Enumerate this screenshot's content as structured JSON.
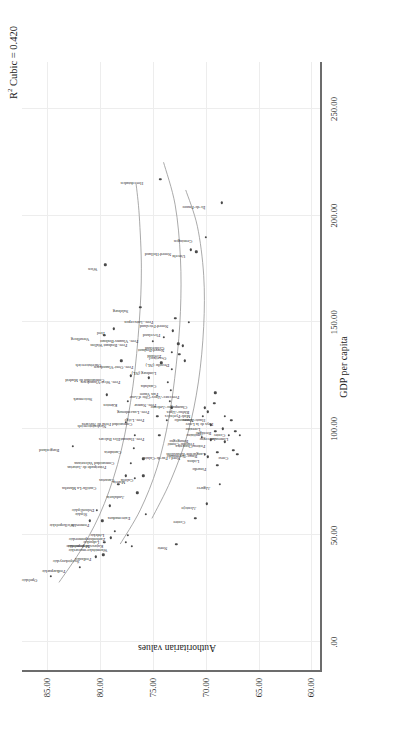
{
  "annotation": {
    "r2_label": "R",
    "r2_sup": "2",
    "r2_rest": " Cubic = 0.420"
  },
  "axes": {
    "x": {
      "title": "GDP per capita",
      "ticks": [
        ".00",
        "50.00",
        "100.00",
        "150.00",
        "200.00",
        "250.00"
      ],
      "tick_values": [
        0,
        50,
        100,
        150,
        200,
        250
      ],
      "min": -14,
      "max": 272
    },
    "y": {
      "title": "Authoritarian values",
      "ticks": [
        "60.00",
        "65.00",
        "70.00",
        "75.00",
        "80.00",
        "85.00"
      ],
      "tick_values": [
        60,
        65,
        70,
        75,
        80,
        85
      ],
      "min": 59.0,
      "max": 87.4
    }
  },
  "chart_data": {
    "type": "scatter",
    "title": "",
    "xlabel": "GDP per capita",
    "ylabel": "Authoritarian values",
    "xlim": [
      -14,
      272
    ],
    "ylim": [
      59.0,
      87.4
    ],
    "grid": true,
    "legend": null,
    "annotations": [
      "R² Cubic = 0.420"
    ],
    "fit": {
      "type": "cubic",
      "r_squared": 0.42,
      "n_curves": 3
    },
    "points": [
      {
        "label": "Opolskie",
        "x": 31,
        "y": 84.7,
        "lx": -2,
        "ly": -16,
        "rot": -90
      },
      {
        "label": "Podkarpackie",
        "x": 35,
        "y": 81.9,
        "lx": -2,
        "ly": -17,
        "rot": -90
      },
      {
        "label": "Świętokrzyskie",
        "x": 40,
        "y": 80.4,
        "lx": -2,
        "ly": -19,
        "rot": -90
      },
      {
        "label": "Wielkopolskie",
        "x": 57,
        "y": 81.0,
        "lx": -2,
        "ly": -18,
        "rot": -90
      },
      {
        "label": "Śląskie",
        "x": 62,
        "y": 80.3,
        "lx": -2,
        "ly": -12,
        "rot": -90
      },
      {
        "label": "Podlaskie",
        "x": 41,
        "y": 79.7,
        "lx": -2,
        "ly": -14,
        "rot": -90
      },
      {
        "label": "Małopolskie",
        "x": 47,
        "y": 79.6,
        "lx": -2,
        "ly": -17,
        "rot": -90
      },
      {
        "label": "Pomorskie",
        "x": 57,
        "y": 79.8,
        "lx": -2,
        "ly": -15,
        "rot": -90
      },
      {
        "label": "Lubuskie",
        "x": 49,
        "y": 79.0,
        "lx": -2,
        "ly": -14,
        "rot": -90
      },
      {
        "label": "Łódzkie",
        "x": 52,
        "y": 78.6,
        "lx": -2,
        "ly": -13,
        "rot": -90
      },
      {
        "label": "Dolnośląskie",
        "x": 64,
        "y": 79.1,
        "lx": -2,
        "ly": -18,
        "rot": -90
      },
      {
        "label": "Kujawsko-pomorskie",
        "x": 47,
        "y": 77.6,
        "lx": -2,
        "ly": -25,
        "rot": -90
      },
      {
        "label": "Zachodniopomorskie",
        "x": 50,
        "y": 77.4,
        "lx": -2,
        "ly": -25,
        "rot": -90
      },
      {
        "label": "Warmińsko-mazurskie",
        "x": 45,
        "y": 77.0,
        "lx": -2,
        "ly": -27,
        "rot": -90
      },
      {
        "label": "Burgenland",
        "x": 92,
        "y": 82.6,
        "lx": -2,
        "ly": -16,
        "rot": -90
      },
      {
        "label": "Castilla-La Mancha",
        "x": 74,
        "y": 78.3,
        "lx": -2,
        "ly": -24,
        "rot": -90
      },
      {
        "label": "Canarias",
        "x": 78,
        "y": 77.6,
        "lx": -2,
        "ly": -14,
        "rot": -90
      },
      {
        "label": "Murcia",
        "x": 77,
        "y": 76.7,
        "lx": -2,
        "ly": -12,
        "rot": -90
      },
      {
        "label": "Andalucía",
        "x": 70,
        "y": 76.5,
        "lx": -2,
        "ly": -15,
        "rot": -90
      },
      {
        "label": "Principado de Asturias",
        "x": 84,
        "y": 77.1,
        "lx": -2,
        "ly": -27,
        "rot": -90
      },
      {
        "label": "Extremadura",
        "x": 60,
        "y": 75.7,
        "lx": -2,
        "ly": -18,
        "rot": -90
      },
      {
        "label": "Cantabria",
        "x": 91,
        "y": 76.8,
        "lx": -2,
        "ly": -15,
        "rot": -90
      },
      {
        "label": "Illes Balears",
        "x": 97,
        "y": 76.7,
        "lx": -2,
        "ly": -17,
        "rot": -90
      },
      {
        "label": "Galicia",
        "x": 78,
        "y": 75.9,
        "lx": -2,
        "ly": -12,
        "rot": -90
      },
      {
        "label": "Comunidad Valenciana",
        "x": 86,
        "y": 75.9,
        "lx": -2,
        "ly": -31,
        "rot": -90
      },
      {
        "label": "Niederösterreich",
        "x": 103,
        "y": 77.6,
        "lx": -2,
        "ly": -22,
        "rot": -90
      },
      {
        "label": "Comunidad de Madrid",
        "x": 125,
        "y": 77.1,
        "lx": -2,
        "ly": -29,
        "rot": -90
      },
      {
        "label": "Kärnten",
        "x": 113,
        "y": 77.4,
        "lx": -2,
        "ly": -13,
        "rot": -90
      },
      {
        "label": "Oberösterreich",
        "x": 132,
        "y": 78.0,
        "lx": -2,
        "ly": -22,
        "rot": -90
      },
      {
        "label": "Steiermark",
        "x": 116,
        "y": 79.4,
        "lx": -2,
        "ly": -17,
        "rot": -90
      },
      {
        "label": "Vorarlberg",
        "x": 144,
        "y": 79.6,
        "lx": -2,
        "ly": -17,
        "rot": -90
      },
      {
        "label": "Tirol",
        "x": 147,
        "y": 78.7,
        "lx": -2,
        "ly": -11,
        "rot": -90
      },
      {
        "label": "Norte",
        "x": 46,
        "y": 72.8,
        "lx": -2,
        "ly": -11,
        "rot": -90
      },
      {
        "label": "Centro",
        "x": 58,
        "y": 71.0,
        "lx": -2,
        "ly": -12,
        "rot": -90
      },
      {
        "label": "Alentejo",
        "x": 65,
        "y": 69.9,
        "lx": -2,
        "ly": -13,
        "rot": -90
      },
      {
        "label": "Algarve",
        "x": 74,
        "y": 68.7,
        "lx": -2,
        "ly": -12,
        "rot": -90
      },
      {
        "label": "Lisboa",
        "x": 87,
        "y": 69.8,
        "lx": -2,
        "ly": -11,
        "rot": -90
      },
      {
        "label": "Prov. Hainaut",
        "x": 97,
        "y": 74.4,
        "lx": -2,
        "ly": -17,
        "rot": -90
      },
      {
        "label": "Prov. Liège",
        "x": 106,
        "y": 74.6,
        "lx": -2,
        "ly": -15,
        "rot": -90
      },
      {
        "label": "Comunidad Foral de Navarra",
        "x": 104,
        "y": 73.7,
        "lx": -2,
        "ly": -37,
        "rot": -90
      },
      {
        "label": "Prov. Luxembourg",
        "x": 110,
        "y": 73.2,
        "lx": -2,
        "ly": -25,
        "rot": -90
      },
      {
        "label": "Prov. Namur",
        "x": 113,
        "y": 73.4,
        "lx": -2,
        "ly": -16,
        "rot": -90
      },
      {
        "label": "País Vasco",
        "x": 118,
        "y": 73.3,
        "lx": -2,
        "ly": -15,
        "rot": -90
      },
      {
        "label": "Cataluña",
        "x": 122,
        "y": 73.6,
        "lx": -2,
        "ly": -14,
        "rot": -90
      },
      {
        "label": "Prov. West-Vlaanderen",
        "x": 124,
        "y": 75.4,
        "lx": -2,
        "ly": -31,
        "rot": -90
      },
      {
        "label": "Prov. Oost-Vlaanderen",
        "x": 131,
        "y": 74.2,
        "lx": -2,
        "ly": -30,
        "rot": -90
      },
      {
        "label": "Prov. Vlaams-Brabant",
        "x": 143,
        "y": 74.0,
        "lx": -2,
        "ly": -28,
        "rot": -90
      },
      {
        "label": "Prov. Brabant Wallon",
        "x": 141,
        "y": 75.0,
        "lx": -2,
        "ly": -28,
        "rot": -90
      },
      {
        "label": "Limburg (NL)",
        "x": 128,
        "y": 73.2,
        "lx": -2,
        "ly": -18,
        "rot": -90
      },
      {
        "label": "Zeeland",
        "x": 136,
        "y": 73.2,
        "lx": -2,
        "ly": -13,
        "rot": -90
      },
      {
        "label": "Gelderland",
        "x": 140,
        "y": 72.6,
        "lx": -2,
        "ly": -16,
        "rot": -90
      },
      {
        "label": "Overijssel",
        "x": 135,
        "y": 72.5,
        "lx": -2,
        "ly": -15,
        "rot": -90
      },
      {
        "label": "Drenthe (NL)",
        "x": 132,
        "y": 72.0,
        "lx": -2,
        "ly": -18,
        "rot": -90
      },
      {
        "label": "Noord-Brabant",
        "x": 139,
        "y": 72.2,
        "lx": -2,
        "ly": -21,
        "rot": -90
      },
      {
        "label": "Flevoland",
        "x": 146,
        "y": 73.1,
        "lx": -2,
        "ly": -15,
        "rot": -90
      },
      {
        "label": "Salzburg",
        "x": 157,
        "y": 76.2,
        "lx": -2,
        "ly": -14,
        "rot": -90
      },
      {
        "label": "Wien",
        "x": 177,
        "y": 79.5,
        "lx": -2,
        "ly": -10,
        "rot": -90
      },
      {
        "label": "Prov. Antwerpen",
        "x": 152,
        "y": 72.9,
        "lx": -2,
        "ly": -24,
        "rot": -90
      },
      {
        "label": "Noord-Friesland",
        "x": 150,
        "y": 71.6,
        "lx": -2,
        "ly": -23,
        "rot": -90
      },
      {
        "label": "Noord-Holland",
        "x": 184,
        "y": 71.4,
        "lx": -2,
        "ly": -22,
        "rot": -90
      },
      {
        "label": "Utrecht",
        "x": 183,
        "y": 70.9,
        "lx": -2,
        "ly": -13,
        "rot": -90
      },
      {
        "label": "Groningen",
        "x": 190,
        "y": 70.0,
        "lx": -2,
        "ly": -16,
        "rot": -90
      },
      {
        "label": "Île-de-France",
        "x": 206,
        "y": 68.5,
        "lx": -2,
        "ly": -19,
        "rot": -90
      },
      {
        "label": "Hovedstaden",
        "x": 217,
        "y": 74.3,
        "lx": -2,
        "ly": -19,
        "rot": -90
      },
      {
        "label": "Picardie",
        "x": 83,
        "y": 68.9,
        "lx": -2,
        "ly": -13,
        "rot": -90
      },
      {
        "label": "Basse-Normandie",
        "x": 89,
        "y": 68.9,
        "lx": -2,
        "ly": -22,
        "rot": -90
      },
      {
        "label": "Aquitaine",
        "x": 99,
        "y": 69.1,
        "lx": -2,
        "ly": -14,
        "rot": -90
      },
      {
        "label": "Poitou-Charentes",
        "x": 94,
        "y": 68.2,
        "lx": -2,
        "ly": -22,
        "rot": -90
      },
      {
        "label": "Bretagne",
        "x": 100,
        "y": 68.4,
        "lx": -2,
        "ly": -14,
        "rot": -90
      },
      {
        "label": "Haute-Normandie",
        "x": 106,
        "y": 68.2,
        "lx": -2,
        "ly": -22,
        "rot": -90
      },
      {
        "label": "Auvergne",
        "x": 97,
        "y": 67.8,
        "lx": -2,
        "ly": -15,
        "rot": -90
      },
      {
        "label": "Pays de la Loire",
        "x": 104,
        "y": 67.6,
        "lx": -2,
        "ly": -20,
        "rot": -90
      },
      {
        "label": "Limousin",
        "x": 97,
        "y": 66.8,
        "lx": -2,
        "ly": -14,
        "rot": -90
      },
      {
        "label": "Languedoc-Roussillon",
        "x": 90,
        "y": 67.4,
        "lx": -2,
        "ly": -30,
        "rot": -90
      },
      {
        "label": "Nord - Pas-de-Calais",
        "x": 88,
        "y": 70.1,
        "lx": -2,
        "ly": -27,
        "rot": -90
      },
      {
        "label": "Bourgogne",
        "x": 96,
        "y": 70.4,
        "lx": -2,
        "ly": -16,
        "rot": -90
      },
      {
        "label": "Franche-Comté",
        "x": 95,
        "y": 69.5,
        "lx": -2,
        "ly": -19,
        "rot": -90
      },
      {
        "label": "Alsace",
        "x": 106,
        "y": 70.3,
        "lx": -2,
        "ly": -11,
        "rot": -90
      },
      {
        "label": "Lorraine",
        "x": 102,
        "y": 69.5,
        "lx": -2,
        "ly": -13,
        "rot": -90
      },
      {
        "label": "Champagne-Ardenne",
        "x": 112,
        "y": 69.2,
        "lx": -2,
        "ly": -29,
        "rot": -90
      },
      {
        "label": "Rhône-Alpes",
        "x": 110,
        "y": 70.1,
        "lx": -2,
        "ly": -18,
        "rot": -90
      },
      {
        "label": "Midi-Pyrénées",
        "x": 108,
        "y": 69.8,
        "lx": -2,
        "ly": -20,
        "rot": -90
      },
      {
        "label": "Provence-Alpes-Côte d'Azur",
        "x": 117,
        "y": 69.1,
        "lx": -2,
        "ly": -38,
        "rot": -90
      },
      {
        "label": "Centre",
        "x": 99,
        "y": 67.2,
        "lx": -2,
        "ly": -12,
        "rot": -90
      },
      {
        "label": "Corse",
        "x": 88,
        "y": 67.0,
        "lx": -2,
        "ly": -11,
        "rot": -90
      }
    ],
    "curves": [
      {
        "name": "curve-1",
        "points": [
          [
            28,
            83.9
          ],
          [
            45,
            81.6
          ],
          [
            65,
            79.6
          ],
          [
            90,
            78.0
          ],
          [
            120,
            76.9
          ],
          [
            150,
            76.3
          ],
          [
            175,
            76.1
          ],
          [
            200,
            76.3
          ],
          [
            215,
            76.6
          ]
        ]
      },
      {
        "name": "curve-2",
        "points": [
          [
            46,
            78.1
          ],
          [
            62,
            76.2
          ],
          [
            82,
            74.6
          ],
          [
            105,
            73.5
          ],
          [
            130,
            72.8
          ],
          [
            155,
            72.4
          ],
          [
            180,
            72.4
          ],
          [
            205,
            72.9
          ],
          [
            225,
            74.0
          ]
        ]
      },
      {
        "name": "curve-3",
        "points": [
          [
            58,
            75.1
          ],
          [
            76,
            73.3
          ],
          [
            98,
            71.7
          ],
          [
            122,
            70.7
          ],
          [
            148,
            70.2
          ],
          [
            172,
            70.2
          ],
          [
            195,
            70.8
          ],
          [
            212,
            71.9
          ]
        ]
      }
    ]
  }
}
